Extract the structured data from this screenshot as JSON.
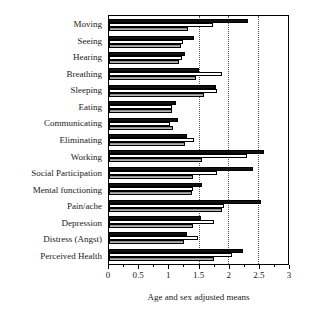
{
  "chart_data": {
    "type": "bar",
    "orientation": "horizontal",
    "title": "",
    "xlabel": "Age and sex adjusted means",
    "ylabel": "",
    "xlim": [
      0,
      3
    ],
    "ylim": null,
    "grid": true,
    "gridlines": [
      1.5,
      2.0,
      2.5
    ],
    "legend": null,
    "legend_position": "none",
    "xticks": [
      0,
      0.5,
      1,
      1.5,
      2,
      2.5,
      3
    ],
    "xtick_labels": [
      "0",
      "0.5",
      "1",
      "1.5",
      "2",
      "2.5",
      "3"
    ],
    "categories": [
      "Moving",
      "Seeing",
      "Hearing",
      "Breathing",
      "Sleeping",
      "Eating",
      "Communicating",
      "Eliminating",
      "Working",
      "Social Participation",
      "Mental functioning",
      "Pain/ache",
      "Depression",
      "Distress (Angst)",
      "Perceived Health"
    ],
    "series": [
      {
        "name": "series-black",
        "color": "#111111",
        "values": [
          2.33,
          1.43,
          1.27,
          1.5,
          1.79,
          1.12,
          1.15,
          1.31,
          2.6,
          2.41,
          1.56,
          2.55,
          1.55,
          1.3,
          2.25
        ]
      },
      {
        "name": "series-white",
        "color": "#ffffff",
        "values": [
          1.74,
          1.24,
          1.22,
          1.89,
          1.81,
          1.05,
          1.03,
          1.43,
          2.31,
          1.81,
          1.4,
          1.92,
          1.76,
          1.49,
          2.06
        ]
      },
      {
        "name": "series-gray",
        "color": "#9a9a9a",
        "values": [
          1.33,
          1.2,
          1.17,
          1.45,
          1.6,
          1.06,
          1.07,
          1.28,
          1.56,
          1.41,
          1.39,
          1.9,
          1.4,
          1.25,
          1.76
        ]
      }
    ]
  }
}
